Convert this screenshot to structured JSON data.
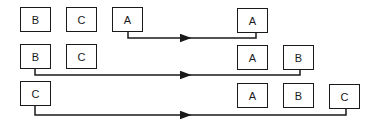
{
  "diagram": {
    "rows": [
      {
        "left": [
          {
            "label": "B",
            "x": 20,
            "y": 7
          },
          {
            "label": "C",
            "x": 66,
            "y": 7
          },
          {
            "label": "A",
            "x": 112,
            "y": 7
          }
        ],
        "right": [
          {
            "label": "A",
            "x": 237,
            "y": 8
          }
        ]
      },
      {
        "left": [
          {
            "label": "B",
            "x": 20,
            "y": 44
          },
          {
            "label": "C",
            "x": 66,
            "y": 44
          }
        ],
        "right": [
          {
            "label": "A",
            "x": 237,
            "y": 45
          },
          {
            "label": "B",
            "x": 283,
            "y": 45
          }
        ]
      },
      {
        "left": [
          {
            "label": "C",
            "x": 20,
            "y": 81
          }
        ],
        "right": [
          {
            "label": "A",
            "x": 237,
            "y": 83
          },
          {
            "label": "B",
            "x": 283,
            "y": 83
          },
          {
            "label": "C",
            "x": 329,
            "y": 84
          }
        ]
      }
    ],
    "colors": {
      "stroke": "#1a1a1a",
      "background": "#ffffff"
    }
  }
}
